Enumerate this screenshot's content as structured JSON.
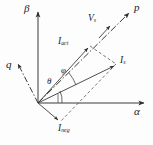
{
  "figure": {
    "type": "phasor-vector-diagram",
    "background_color": "#fdfdfd",
    "line_color": "#333333",
    "text_color": "#1b1b1b"
  },
  "axes": {
    "alpha": {
      "label": "α",
      "kind": "solid",
      "direction": "right",
      "x": 134,
      "y": 110
    },
    "beta": {
      "label": "β",
      "kind": "solid",
      "direction": "up",
      "x": 24,
      "y": 3
    },
    "p": {
      "label": "p",
      "kind": "dash-dot",
      "direction": "up-right",
      "x": 134,
      "y": 2
    },
    "q": {
      "label": "q",
      "kind": "dash-dot",
      "direction": "up-left",
      "x": 6,
      "y": 59
    }
  },
  "vectors": [
    {
      "name": "V_s",
      "base": "V",
      "sub": "s",
      "label_x": 88,
      "label_y": 14,
      "kind": "voltage-on-p-axis"
    },
    {
      "name": "I_act",
      "base": "I",
      "sub": "act",
      "label_x": 58,
      "label_y": 37,
      "kind": "active-current"
    },
    {
      "name": "I_s",
      "base": "I",
      "sub": "s",
      "label_x": 120,
      "label_y": 56,
      "kind": "source-current"
    },
    {
      "name": "I_neg",
      "base": "I",
      "sub": "neg",
      "label_x": 58,
      "label_y": 124,
      "kind": "negative-sequence-current"
    }
  ],
  "angles": [
    {
      "name": "theta",
      "label": "θ",
      "label_x": 47,
      "label_y": 77,
      "between": "alpha-axis-and-I_s"
    },
    {
      "name": "phi",
      "label": "φ",
      "label_x": 61,
      "label_y": 66,
      "between": "I_s-and-p-axis"
    }
  ],
  "geometry": {
    "origin": {
      "x": 38,
      "y": 103
    },
    "alpha_tip": {
      "x": 146,
      "y": 103
    },
    "beta_tip": {
      "x": 38,
      "y": 10
    },
    "p_tip": {
      "x": 131,
      "y": 11
    },
    "q_tip": {
      "x": 16,
      "y": 62
    },
    "Is_tip": {
      "x": 116,
      "y": 64
    },
    "Iact_tip": {
      "x": 90,
      "y": 46
    },
    "Ineg_tip": {
      "x": 60,
      "y": 122
    }
  }
}
